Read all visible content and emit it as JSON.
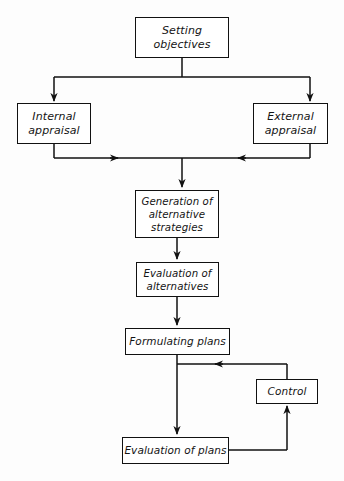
{
  "diagram": {
    "type": "flowchart",
    "style": {
      "background": "#fdfdfd",
      "line_color": "#111111",
      "box_border_color": "#111111",
      "box_fill": "#ffffff",
      "text_color": "#141414"
    },
    "nodes": [
      {
        "id": "setting-objectives",
        "lines": [
          "Setting",
          "objectives"
        ]
      },
      {
        "id": "internal-appraisal",
        "lines": [
          "Internal",
          "appraisal"
        ]
      },
      {
        "id": "external-appraisal",
        "lines": [
          "External",
          "appraisal"
        ]
      },
      {
        "id": "generation-of-alternative-strategies",
        "lines": [
          "Generation of",
          "alternative",
          "strategies"
        ]
      },
      {
        "id": "evaluation-of-alternatives",
        "lines": [
          "Evaluation of",
          "alternatives"
        ]
      },
      {
        "id": "formulating-plans",
        "lines": [
          "Formulating plans"
        ]
      },
      {
        "id": "control",
        "lines": [
          "Control"
        ]
      },
      {
        "id": "evaluation-of-plans",
        "lines": [
          "Evaluation of plans"
        ]
      }
    ],
    "edges": [
      {
        "id": "edge-setting-to-internal",
        "from": "setting-objectives",
        "to": "internal-appraisal",
        "arrow": "down"
      },
      {
        "id": "edge-setting-to-external",
        "from": "setting-objectives",
        "to": "external-appraisal",
        "arrow": "down"
      },
      {
        "id": "edge-internal-to-merge",
        "from": "internal-appraisal",
        "to": "merge-point",
        "arrow": "right"
      },
      {
        "id": "edge-external-to-merge",
        "from": "external-appraisal",
        "to": "merge-point",
        "arrow": "left"
      },
      {
        "id": "edge-merge-to-generation",
        "from": "merge-point",
        "to": "generation-of-alternative-strategies",
        "arrow": "down"
      },
      {
        "id": "edge-generation-to-evalalt",
        "from": "generation-of-alternative-strategies",
        "to": "evaluation-of-alternatives",
        "arrow": "down"
      },
      {
        "id": "edge-evalalt-to-formulating",
        "from": "evaluation-of-alternatives",
        "to": "formulating-plans",
        "arrow": "down"
      },
      {
        "id": "edge-formulating-to-evalplans",
        "from": "formulating-plans",
        "to": "evaluation-of-plans",
        "arrow": "down"
      },
      {
        "id": "edge-evalplans-to-control",
        "from": "evaluation-of-plans",
        "to": "control",
        "arrow": "up"
      },
      {
        "id": "edge-control-feedback",
        "from": "control",
        "to": "formulating-plans-trunk",
        "arrow": "left"
      }
    ]
  }
}
